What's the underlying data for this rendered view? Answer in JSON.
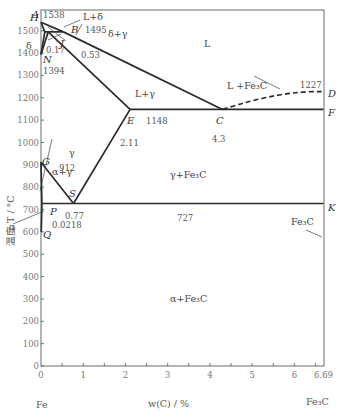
{
  "diagram": {
    "type": "phase-diagram",
    "x_axis": {
      "label": "w(C) / %",
      "range": [
        0,
        6.69
      ],
      "ticks": [
        0,
        1,
        2,
        3,
        4,
        5,
        6,
        6.69
      ],
      "minor_step": 0.5,
      "left_component": "Fe",
      "right_component": "Fe₃C"
    },
    "y_axis": {
      "label": "温度 T / °C",
      "range": [
        0,
        1600
      ],
      "ticks": [
        0,
        100,
        200,
        300,
        400,
        500,
        600,
        700,
        800,
        900,
        1000,
        1100,
        1200,
        1300,
        1400,
        1500
      ]
    },
    "points": [
      {
        "name": "A",
        "c": 0,
        "t": 1538
      },
      {
        "name": "H",
        "c": 0.09,
        "t": 1495
      },
      {
        "name": "J",
        "c": 0.17,
        "t": 1495
      },
      {
        "name": "B",
        "c": 0.53,
        "t": 1495
      },
      {
        "name": "N",
        "c": 0,
        "t": 1394
      },
      {
        "name": "E",
        "c": 2.11,
        "t": 1148
      },
      {
        "name": "C",
        "c": 4.3,
        "t": 1148
      },
      {
        "name": "F",
        "c": 6.69,
        "t": 1148
      },
      {
        "name": "D",
        "c": 6.69,
        "t": 1227
      },
      {
        "name": "G",
        "c": 0,
        "t": 912
      },
      {
        "name": "S",
        "c": 0.77,
        "t": 727
      },
      {
        "name": "P",
        "c": 0.0218,
        "t": 727
      },
      {
        "name": "K",
        "c": 6.69,
        "t": 727
      },
      {
        "name": "Q",
        "c": 0.0057,
        "t": 600
      }
    ],
    "point_labels": {
      "A": "A",
      "H": "H",
      "J": "J",
      "B": "B",
      "N": "N",
      "E": "E",
      "C": "C",
      "F": "F",
      "D": "D",
      "G": "G",
      "S": "S",
      "P": "P",
      "K": "K",
      "Q": "Q"
    },
    "value_labels": {
      "t1538": "1538",
      "t1495": "1495",
      "t1394": "1394",
      "t1148": "1148",
      "t1227": "1227",
      "t912": "912",
      "t727": "727",
      "c017": "0.17",
      "c053": "0.53",
      "c211": "2.11",
      "c43": "4.3",
      "c077": "0.77",
      "c00218": "0.0218",
      "c669": "6.69"
    },
    "regions": {
      "L": "L",
      "L_delta": "L+δ",
      "delta_gamma": "δ+γ",
      "delta": "δ",
      "L_gamma": "L+γ",
      "L_Fe3C": "L +Fe₃C",
      "gamma": "γ",
      "alpha_gamma": "α+γ",
      "gamma_Fe3C": "γ+Fe₃C",
      "alpha": "α",
      "alpha_Fe3C": "α+Fe₃C",
      "Fe3C": "Fe₃C"
    },
    "lines": {
      "liquidus": [
        "A-B",
        "B-C",
        "C-D"
      ],
      "solidus": [
        "A-H",
        "J-E",
        "E-C-F"
      ],
      "peritectic": "H-J-B",
      "eutectic": "E-C-F",
      "eutectoid": "P-S-K",
      "others": [
        "H-N",
        "J-N",
        "G-S",
        "G-P",
        "E-S",
        "P-Q"
      ]
    },
    "caption": ""
  }
}
